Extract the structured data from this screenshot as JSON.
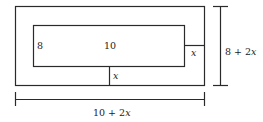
{
  "diagram": {
    "type": "rectangle-border-dimensions",
    "colors": {
      "stroke": "#2a2a2a",
      "text": "#222222",
      "background": "#ffffff"
    },
    "inner_rect": {
      "width_label": "10",
      "height_label": "8"
    },
    "border_labels": {
      "right_gap": "x",
      "bottom_gap": "x"
    },
    "outer_dimensions": {
      "width_label_num": "10 + 2",
      "width_label_var": "x",
      "height_label_num": "8 + 2",
      "height_label_var": "x"
    }
  }
}
